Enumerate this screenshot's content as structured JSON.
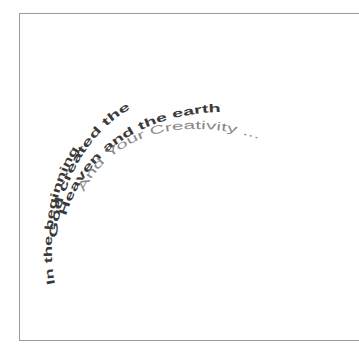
{
  "canvas": {
    "background": "#ffffff",
    "border_color": "#9a9a9a"
  },
  "artwork": {
    "description": "Curved text arranged in concentric arcs",
    "lines": [
      {
        "text": "In the beginning",
        "color": "#3a3a3a",
        "weight": "bold"
      },
      {
        "text": "God created the",
        "color": "#3a3a3a",
        "weight": "bold"
      },
      {
        "text": "Heaven and the earth",
        "color": "#3a3a3a",
        "weight": "bold"
      },
      {
        "text": "And Your Creativity ...",
        "color": "#8a8a8a",
        "weight": "normal"
      }
    ]
  }
}
